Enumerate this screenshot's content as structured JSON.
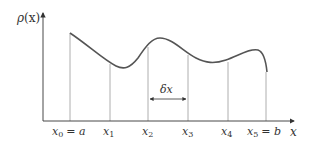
{
  "diagram": {
    "y_axis_label": {
      "base": "ρ",
      "arg": "(x)"
    },
    "x_axis_label": "x",
    "interval_label": "δx",
    "ticks": [
      {
        "var": "x",
        "sub": "0",
        "eq": "= a"
      },
      {
        "var": "x",
        "sub": "1",
        "eq": ""
      },
      {
        "var": "x",
        "sub": "2",
        "eq": ""
      },
      {
        "var": "x",
        "sub": "3",
        "eq": ""
      },
      {
        "var": "x",
        "sub": "4",
        "eq": ""
      },
      {
        "var": "x",
        "sub": "5",
        "eq": "= b"
      }
    ],
    "colors": {
      "curve": "#555555",
      "axis": "#333333",
      "gridline": "#999999",
      "text": "#333333"
    }
  }
}
